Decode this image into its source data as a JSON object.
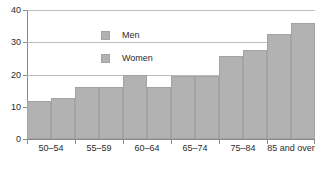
{
  "chart_data": {
    "type": "bar",
    "title": "",
    "subtitle": "",
    "xlabel": "",
    "ylabel": "",
    "categories": [
      "50–54",
      "55–59",
      "60–64",
      "65–74",
      "75–84",
      "85 and over"
    ],
    "series": [
      {
        "name": "Men",
        "values": [
          11.8,
          16.0,
          20.0,
          19.4,
          25.6,
          32.7
        ],
        "color": "#b2b2b2"
      },
      {
        "name": "Women",
        "values": [
          12.7,
          16.0,
          16.0,
          19.6,
          27.7,
          36.0
        ],
        "color": "#b2b2b2"
      }
    ],
    "ylim": [
      0,
      40
    ],
    "yticks": [
      0,
      10,
      20,
      30,
      40
    ],
    "ytick_labels": [
      "0",
      "10",
      "20",
      "30",
      "40"
    ],
    "grid": true,
    "grid_axis": "y",
    "legend_position": "upper-left-inside",
    "bar_mode": "grouped",
    "annotations": []
  },
  "legend": {
    "items": [
      {
        "label": "Men"
      },
      {
        "label": "Women"
      }
    ]
  },
  "axis": {
    "y_tick_labels": [
      "0",
      "10",
      "20",
      "30",
      "40"
    ],
    "x_tick_labels": [
      "50–54",
      "55–59",
      "60–64",
      "65–74",
      "75–84",
      "85 and over"
    ]
  }
}
